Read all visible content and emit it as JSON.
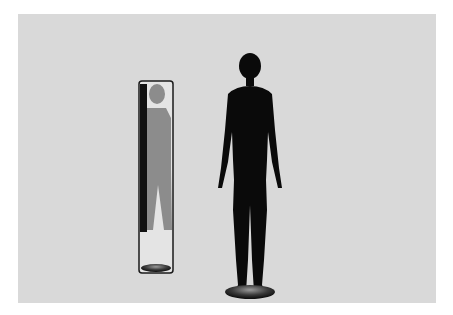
{
  "scene": {
    "description": "Black mannequin silhouette standing beside a tall floor mirror showing a gray reflection, on a light gray textured background",
    "colors": {
      "page_background": "#ffffff",
      "panel_background": "#d9d9d9",
      "mannequin": "#0a0a0a",
      "reflection": "#8c8c8c",
      "mirror_frame": "#1a1a1a",
      "mirror_glass": "#e4e4e4"
    }
  }
}
